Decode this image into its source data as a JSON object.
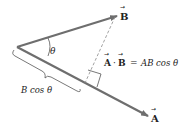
{
  "diagram": {
    "type": "vector-dot-product",
    "vectors": [
      {
        "name": "A",
        "label": "A",
        "has_arrow_accent": true
      },
      {
        "name": "B",
        "label": "B",
        "has_arrow_accent": true
      }
    ],
    "angle_label": "θ",
    "projection_label": "B cos θ",
    "equation": {
      "lhs_a": "A",
      "dot": "·",
      "lhs_b": "B",
      "equals": "=",
      "rhs": "AB cos θ"
    },
    "colors": {
      "vector": "#6e6e6e",
      "dashed": "#8a8a8a",
      "text": "#222222",
      "background": "#ffffff"
    }
  }
}
